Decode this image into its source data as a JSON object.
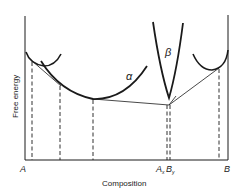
{
  "diagram": {
    "title": "",
    "ylabel": "Free energy",
    "xlabel": "Composition",
    "curve_labels": {
      "alpha": "α",
      "beta": "β"
    },
    "x_ticks": {
      "left": "A",
      "mid_a": "A",
      "mid_a_sub": "x",
      "mid_b": "B",
      "mid_b_sub": "y",
      "right": "B"
    },
    "colors": {
      "line": "#1a1a1a",
      "background": "#ffffff"
    },
    "elements": [
      "left terminal free-energy curve",
      "alpha free-energy curve",
      "beta free-energy curve",
      "right terminal free-energy curve",
      "common tangent lines",
      "dashed vertical drop lines to composition axis"
    ]
  }
}
